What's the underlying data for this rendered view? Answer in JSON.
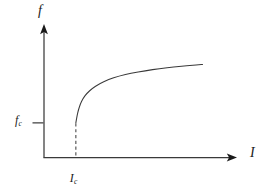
{
  "figure": {
    "background_color": "#ffffff",
    "line_color": "#3a3a3a",
    "arrow_color": "#1a1a1a",
    "tick_color": "#6a6a6a",
    "dash_color": "#4a4a4a"
  },
  "labels": {
    "y_axis": {
      "symbol": "f",
      "subscript": ""
    },
    "x_axis": {
      "symbol": "I",
      "subscript": ""
    },
    "y_threshold": {
      "symbol": "f",
      "subscript": "c"
    },
    "x_threshold": {
      "symbol": "I",
      "subscript": "c"
    }
  },
  "chart_data": {
    "type": "line",
    "title": "",
    "xlabel": "I",
    "ylabel": "f",
    "grid": false,
    "legend": null,
    "xlim": [
      0,
      1
    ],
    "ylim": [
      0,
      1
    ],
    "annotations": [
      {
        "name": "y-threshold-tick",
        "axis": "y",
        "label": "f_c",
        "value": 0.295
      },
      {
        "name": "x-threshold-dashed-line",
        "axis": "x",
        "label": "I_c",
        "value": 0.176
      }
    ],
    "series": [
      {
        "name": "threshold-response",
        "style": "solid",
        "description": "Square-root-like rise above threshold I_c starting at f_c",
        "x": [
          0.176,
          0.18,
          0.186,
          0.195,
          0.208,
          0.226,
          0.251,
          0.285,
          0.33,
          0.385,
          0.45,
          0.52,
          0.6,
          0.68,
          0.76,
          0.84,
          0.876
        ],
        "y": [
          0.295,
          0.33,
          0.378,
          0.428,
          0.478,
          0.524,
          0.566,
          0.606,
          0.644,
          0.678,
          0.706,
          0.728,
          0.748,
          0.764,
          0.777,
          0.788,
          0.792
        ]
      }
    ]
  }
}
